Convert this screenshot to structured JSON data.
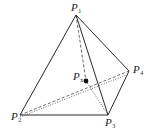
{
  "diagram": {
    "type": "tetrahedron",
    "colors": {
      "line": "#2a2a2a",
      "point": "#111111",
      "background": "#ffffff"
    },
    "points": {
      "P1": {
        "base": "P",
        "sub": "1",
        "x": 76,
        "y": 15
      },
      "P2": {
        "base": "P",
        "sub": "2",
        "x": 20,
        "y": 115
      },
      "P3": {
        "base": "P",
        "sub": "3",
        "x": 108,
        "y": 115
      },
      "P4": {
        "base": "P",
        "sub": "4",
        "x": 129,
        "y": 71
      },
      "Px": {
        "base": "P",
        "sub": "x",
        "x": 86,
        "y": 81
      }
    },
    "edges": {
      "solid": [
        [
          "P1",
          "P2"
        ],
        [
          "P1",
          "P3"
        ],
        [
          "P1",
          "P4"
        ],
        [
          "P2",
          "P3"
        ],
        [
          "P3",
          "P4"
        ]
      ],
      "dashed": [
        [
          "P1",
          "Px"
        ],
        [
          "P2",
          "P4"
        ]
      ],
      "dotted": [
        [
          "P2",
          "P4"
        ],
        [
          "Px",
          "P3"
        ]
      ]
    }
  }
}
